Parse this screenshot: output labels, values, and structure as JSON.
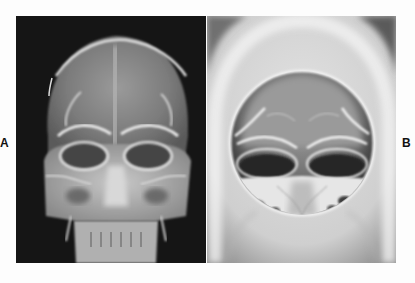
{
  "figure": {
    "panels": [
      {
        "id": "A",
        "label": "A",
        "description": "Frontal (PA) skull radiograph",
        "background_color": "#151515"
      },
      {
        "id": "B",
        "label": "B",
        "description": "Frontal skull radiograph with circular collimation (cone-down view), edge-enhanced",
        "background_color": "#c9c9c9"
      }
    ]
  }
}
